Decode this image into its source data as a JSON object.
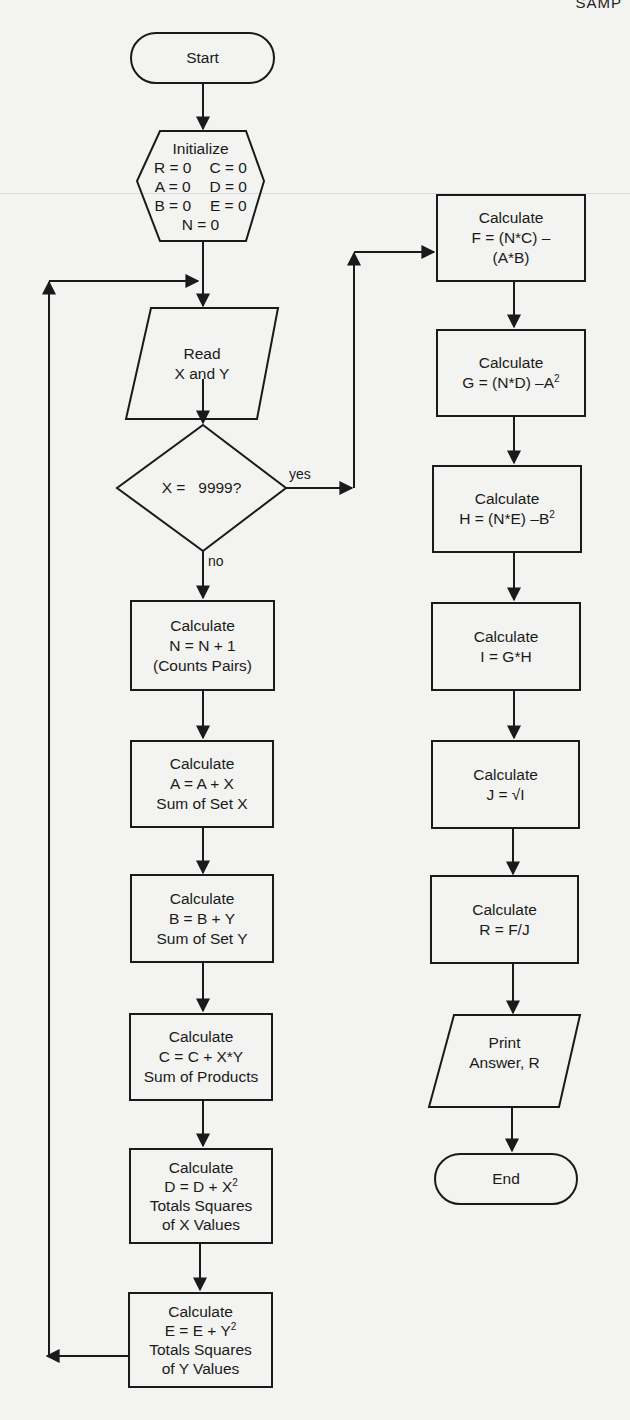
{
  "page": {
    "corner_text": "SAMP"
  },
  "flowchart": {
    "start": {
      "label": "Start"
    },
    "initialize": {
      "title": "Initialize",
      "rows": [
        [
          "R = 0",
          "C = 0"
        ],
        [
          "A = 0",
          "D = 0"
        ],
        [
          "B = 0",
          "E = 0"
        ]
      ],
      "last": "N = 0"
    },
    "read": {
      "line1": "Read",
      "line2": "X and Y"
    },
    "decision": {
      "label": "X =   9999?",
      "yes": "yes",
      "no": "no"
    },
    "left_steps": [
      {
        "title": "Calculate",
        "line1": "N = N + 1",
        "line2": "(Counts Pairs)"
      },
      {
        "title": "Calculate",
        "line1": "A = A + X",
        "line2": "Sum of Set X"
      },
      {
        "title": "Calculate",
        "line1": "B = B + Y",
        "line2": "Sum of Set Y"
      },
      {
        "title": "Calculate",
        "line1": "C = C + X*Y",
        "line2": "Sum of Products"
      },
      {
        "title": "Calculate",
        "line1_base": "D = D + X",
        "line1_sup": "2",
        "line2": "Totals Squares",
        "line3": "of X Values"
      },
      {
        "title": "Calculate",
        "line1_base": "E = E + Y",
        "line1_sup": "2",
        "line2": "Totals Squares",
        "line3": "of Y Values"
      }
    ],
    "right_steps": [
      {
        "title": "Calculate",
        "line1": "F = (N*C) –",
        "line2": "(A*B)"
      },
      {
        "title": "Calculate",
        "line1_base": "G = (N*D) –A",
        "line1_sup": "2"
      },
      {
        "title": "Calculate",
        "line1_base": "H = (N*E) –B",
        "line1_sup": "2"
      },
      {
        "title": "Calculate",
        "line1": "I = G*H"
      },
      {
        "title": "Calculate",
        "line1": "J = √I"
      },
      {
        "title": "Calculate",
        "line1": "R = F/J"
      }
    ],
    "print": {
      "line1": "Print",
      "line2": "Answer, R"
    },
    "end": {
      "label": "End"
    }
  }
}
